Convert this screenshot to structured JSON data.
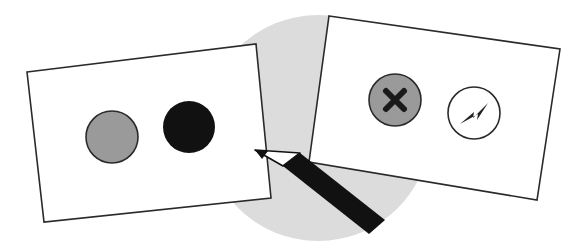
{
  "illustration": {
    "description": "Two cards with circle markers and a pencil over a light gray circle",
    "colors": {
      "background": "#ffffff",
      "backdrop_circle": "#dcdcdc",
      "card_fill": "#ffffff",
      "card_stroke": "#2a2a2a",
      "gray_circle": "#9a9a9a",
      "black_circle": "#111111",
      "pencil_body": "#111111"
    },
    "left_card": {
      "markers": [
        "gray-filled-circle",
        "black-filled-circle"
      ]
    },
    "right_card": {
      "markers": [
        "close-icon",
        "lightning-icon"
      ]
    },
    "tool": "pencil-icon"
  }
}
